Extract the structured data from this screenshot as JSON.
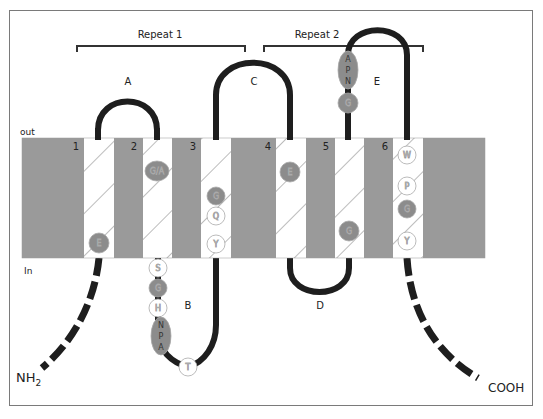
{
  "figure": {
    "repeats": [
      {
        "label": "Repeat 1",
        "x1": 77,
        "x2": 245,
        "y": 46
      },
      {
        "label": "Repeat 2",
        "x1": 264,
        "x2": 423,
        "y": 46
      }
    ],
    "side_labels": {
      "out": "out",
      "in": "In"
    },
    "termini": {
      "n": "NH",
      "n_sub": "2",
      "c": "COOH"
    },
    "helices": [
      {
        "number": "1",
        "x": 84
      },
      {
        "number": "2",
        "x": 143
      },
      {
        "number": "3",
        "x": 201
      },
      {
        "number": "4",
        "x": 276
      },
      {
        "number": "5",
        "x": 335
      },
      {
        "number": "6",
        "x": 393
      }
    ],
    "loops": [
      {
        "label": "A",
        "side": "out",
        "x": 128,
        "y": 85
      },
      {
        "label": "B",
        "side": "in",
        "x": 188,
        "y": 306
      },
      {
        "label": "C",
        "side": "out",
        "x": 254,
        "y": 82
      },
      {
        "label": "D",
        "side": "in",
        "x": 320,
        "y": 305
      },
      {
        "label": "E",
        "side": "out",
        "x": 377,
        "y": 82
      }
    ],
    "residues": [
      {
        "label": "E",
        "fill": "gray",
        "cx": 99,
        "cy": 243
      },
      {
        "label": "G/A",
        "fill": "gray",
        "cx": 157,
        "cy": 171
      },
      {
        "label": "G",
        "fill": "gray",
        "cx": 216,
        "cy": 196
      },
      {
        "label": "Q",
        "fill": "white",
        "cx": 216,
        "cy": 216
      },
      {
        "label": "Y",
        "fill": "white",
        "cx": 216,
        "cy": 244
      },
      {
        "label": "E",
        "fill": "gray",
        "cx": 290,
        "cy": 172
      },
      {
        "label": "G",
        "fill": "gray",
        "cx": 349,
        "cy": 231
      },
      {
        "label": "W",
        "fill": "white",
        "cx": 407,
        "cy": 155
      },
      {
        "label": "P",
        "fill": "white",
        "cx": 407,
        "cy": 186
      },
      {
        "label": "G",
        "fill": "gray",
        "cx": 407,
        "cy": 209
      },
      {
        "label": "Y",
        "fill": "white",
        "cx": 407,
        "cy": 241
      },
      {
        "label": "S",
        "fill": "white",
        "cx": 158,
        "cy": 268
      },
      {
        "label": "G",
        "fill": "gray",
        "cx": 158,
        "cy": 288
      },
      {
        "label": "H",
        "fill": "white",
        "cx": 158,
        "cy": 308
      },
      {
        "label": "T",
        "fill": "white",
        "cx": 188,
        "cy": 367
      },
      {
        "label": "G",
        "fill": "gray",
        "cx": 348,
        "cy": 103
      }
    ],
    "motifs": [
      {
        "label": "NPA",
        "letters": [
          "N",
          "P",
          "A"
        ],
        "cx": 161,
        "cy": 336
      },
      {
        "label": "APN",
        "letters": [
          "A",
          "P",
          "N"
        ],
        "cx": 348,
        "cy": 70
      }
    ],
    "colors": {
      "helix_gray": "#9a9a9a",
      "residue_gray": "#8c8c8c",
      "loop": "#1e1e1e",
      "frame": "#7a7a7a",
      "hatch": "#7a7a7a"
    }
  }
}
